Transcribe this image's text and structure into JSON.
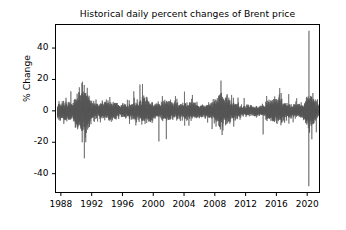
{
  "chart_data": {
    "type": "line",
    "title": "Historical daily percent changes of Brent price",
    "xlabel": "",
    "ylabel": "% Change",
    "grid": false,
    "legend": null,
    "line_color": "#595959",
    "background_color": "#ffffff",
    "xlim": [
      1987.3,
      2021.6
    ],
    "ylim": [
      -52,
      55
    ],
    "xticks": [
      1988,
      1992,
      1996,
      2000,
      2004,
      2008,
      2012,
      2016,
      2020
    ],
    "xtick_labels": [
      "1988",
      "1992",
      "1996",
      "2000",
      "2004",
      "2008",
      "2012",
      "2016",
      "2020"
    ],
    "yticks": [
      -40,
      -20,
      0,
      20,
      40
    ],
    "ytick_labels": [
      "-40",
      "-20",
      "0",
      "20",
      "40"
    ],
    "series_name": "Brent daily % change",
    "notable_events": [
      {
        "year": 1990.8,
        "value": 18.6,
        "label": "Gulf War spike"
      },
      {
        "year": 1991.05,
        "value": -30.2,
        "label": "Gulf War crash"
      },
      {
        "year": 1998.6,
        "value": 17.1,
        "label": "1998 spike"
      },
      {
        "year": 2001.7,
        "value": -18.0,
        "label": "Sept 2001 drop"
      },
      {
        "year": 2008.8,
        "value": 19.3,
        "label": "Financial crisis spike"
      },
      {
        "year": 2008.95,
        "value": -15.4,
        "label": "Financial crisis drop"
      },
      {
        "year": 2020.23,
        "value": 51.0,
        "label": "COVID rebound spike"
      },
      {
        "year": 2020.21,
        "value": -48.0,
        "label": "COVID crash"
      }
    ],
    "typical_range": [
      -6,
      6
    ]
  }
}
